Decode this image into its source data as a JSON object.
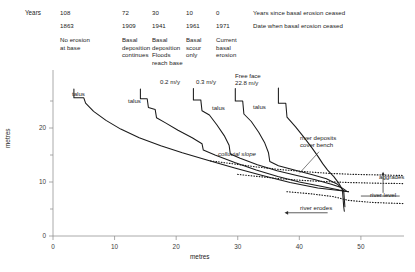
{
  "header": {
    "years_label": "Years",
    "columns": [
      {
        "years": "108",
        "date": "1863",
        "desc": "No erosion\nat base"
      },
      {
        "years": "72",
        "date": "1909",
        "desc": "Basal\ndeposition\ncontinues"
      },
      {
        "years": "30",
        "date": "1941",
        "desc": "Basal\ndeposition\nFloods\nreach base"
      },
      {
        "years": "10",
        "date": "1961",
        "desc": "Basal\nscour\nonly"
      },
      {
        "years": "0",
        "date": "1971",
        "desc": "Current\nbasal\nerosion"
      }
    ],
    "row_legend_years": "Years since basal erosion ceased",
    "row_legend_date": "Date when basal erosion ceased"
  },
  "chart_data": {
    "type": "line",
    "title": "",
    "xlabel": "metres",
    "ylabel": "metres",
    "xlim": [
      0,
      57
    ],
    "ylim": [
      0,
      30
    ],
    "xticks": [
      0,
      10,
      20,
      30,
      40,
      50
    ],
    "xticklabels": [
      "0",
      "10",
      "20",
      "30",
      "40",
      "50"
    ],
    "yticks": [
      0,
      5,
      10,
      15,
      20,
      25
    ],
    "yticklabels": [
      "0",
      "",
      "10",
      "",
      "20",
      ""
    ],
    "grid": false,
    "legend": "none",
    "series": [
      {
        "name": "1863 profile (108 years)",
        "retreat_label": "",
        "points": [
          [
            3.4,
            27.2
          ],
          [
            3.4,
            25.6
          ],
          [
            5.0,
            25.6
          ],
          [
            5.3,
            24.6
          ],
          [
            6.6,
            23.1
          ],
          [
            8.6,
            21.4
          ],
          [
            11.0,
            19.8
          ],
          [
            14.0,
            18.2
          ],
          [
            17.5,
            16.7
          ],
          [
            21.0,
            15.4
          ],
          [
            25.0,
            14.1
          ],
          [
            29.5,
            12.6
          ],
          [
            34.0,
            11.2
          ],
          [
            38.5,
            9.9
          ],
          [
            43.0,
            8.9
          ],
          [
            46.5,
            8.4
          ],
          [
            48.0,
            8.2
          ]
        ]
      },
      {
        "name": "1909 profile (72 years)",
        "retreat_label": "",
        "points": [
          [
            14.2,
            27.2
          ],
          [
            14.2,
            25.4
          ],
          [
            15.3,
            25.4
          ],
          [
            15.5,
            23.8
          ],
          [
            16.6,
            23.4
          ],
          [
            16.8,
            21.9
          ],
          [
            18.2,
            21.0
          ],
          [
            20.3,
            19.6
          ],
          [
            22.6,
            18.2
          ],
          [
            24.2,
            17.1
          ],
          [
            24.4,
            15.9
          ],
          [
            26.3,
            15.0
          ],
          [
            29.5,
            13.6
          ],
          [
            33.0,
            12.2
          ],
          [
            36.5,
            11.0
          ],
          [
            40.0,
            10.0
          ],
          [
            43.5,
            9.2
          ],
          [
            46.5,
            8.5
          ],
          [
            48.0,
            8.2
          ]
        ]
      },
      {
        "name": "1941 profile (30 years)",
        "retreat_label": "0.2 m/y",
        "points": [
          [
            22.8,
            27.3
          ],
          [
            22.8,
            25.2
          ],
          [
            24.0,
            25.2
          ],
          [
            24.2,
            23.2
          ],
          [
            25.4,
            22.4
          ],
          [
            26.6,
            20.6
          ],
          [
            27.8,
            18.6
          ],
          [
            28.6,
            16.8
          ],
          [
            28.8,
            15.2
          ],
          [
            30.4,
            14.4
          ],
          [
            33.2,
            13.2
          ],
          [
            36.4,
            12.1
          ],
          [
            39.6,
            11.2
          ],
          [
            42.6,
            10.4
          ],
          [
            45.2,
            9.6
          ],
          [
            46.8,
            9.0
          ],
          [
            47.6,
            8.4
          ]
        ]
      },
      {
        "name": "1961 profile (10 years)",
        "retreat_label": "0.3 m/y",
        "points": [
          [
            29.6,
            27.3
          ],
          [
            29.6,
            25.0
          ],
          [
            30.8,
            25.0
          ],
          [
            31.0,
            22.6
          ],
          [
            32.2,
            21.2
          ],
          [
            33.4,
            19.2
          ],
          [
            34.4,
            17.2
          ],
          [
            35.0,
            15.4
          ],
          [
            35.2,
            13.8
          ],
          [
            36.6,
            13.0
          ],
          [
            39.2,
            12.2
          ],
          [
            42.0,
            11.4
          ],
          [
            44.4,
            10.6
          ],
          [
            46.2,
            9.6
          ],
          [
            47.2,
            8.4
          ],
          [
            47.4,
            5.4
          ]
        ]
      },
      {
        "name": "1971 profile (0 years, current)",
        "retreat_label": "Free face\n22.8 m/y",
        "points": [
          [
            36.6,
            27.4
          ],
          [
            36.6,
            24.6
          ],
          [
            37.8,
            24.6
          ],
          [
            38.0,
            22.0
          ],
          [
            39.4,
            20.2
          ],
          [
            40.8,
            18.2
          ],
          [
            42.0,
            16.4
          ],
          [
            43.0,
            14.8
          ],
          [
            43.8,
            13.4
          ],
          [
            44.6,
            12.2
          ],
          [
            45.6,
            11.0
          ],
          [
            46.4,
            9.8
          ],
          [
            47.0,
            8.6
          ],
          [
            47.2,
            5.4
          ],
          [
            47.3,
            4.6
          ]
        ]
      }
    ],
    "buried_surfaces": [
      {
        "name": "upper buried bench (colluvial)",
        "points": [
          [
            25.6,
            13.9
          ],
          [
            29.0,
            13.4
          ],
          [
            33.0,
            12.8
          ],
          [
            37.0,
            12.3
          ],
          [
            41.0,
            11.9
          ],
          [
            45.0,
            11.6
          ],
          [
            49.0,
            11.4
          ],
          [
            53.5,
            11.3
          ],
          [
            57.0,
            11.2
          ]
        ]
      },
      {
        "name": "lower buried bench (river deposits)",
        "points": [
          [
            30.0,
            11.4
          ],
          [
            33.5,
            11.0
          ],
          [
            37.0,
            10.6
          ],
          [
            40.5,
            10.3
          ],
          [
            44.0,
            10.1
          ],
          [
            48.0,
            9.9
          ],
          [
            52.0,
            9.8
          ],
          [
            57.0,
            9.7
          ]
        ]
      },
      {
        "name": "basal river bed line",
        "points": [
          [
            38.0,
            8.2
          ],
          [
            42.0,
            7.8
          ],
          [
            45.5,
            7.3
          ],
          [
            48.0,
            6.6
          ],
          [
            52.0,
            6.2
          ],
          [
            57.0,
            6.0
          ]
        ]
      }
    ],
    "annotations": [
      {
        "text": "talus",
        "x": 9.0,
        "y": 23.0
      },
      {
        "text": "talus",
        "x": 20.2,
        "y": 21.7
      },
      {
        "text": "talus",
        "x": 33.6,
        "y": 20.4
      },
      {
        "text": "talus",
        "x": 41.4,
        "y": 20.6
      },
      {
        "text": "colluvial slope",
        "x": 33.0,
        "y": 14.6
      },
      {
        "text": "river deposits\ncover bench",
        "x": 44.0,
        "y": 16.6
      },
      {
        "text": "aggrades",
        "x": 55.0,
        "y": 10.4
      },
      {
        "text": "river level",
        "x": 55.0,
        "y": 8.2
      },
      {
        "text": "river erodes",
        "x": 37.0,
        "y": 5.2
      }
    ]
  }
}
